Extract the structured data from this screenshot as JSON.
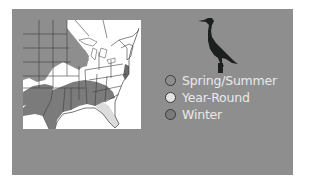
{
  "figure": {
    "icon": "cormorant-silhouette-icon",
    "colors": {
      "panel_background": "#8e8e8e",
      "map_background": "#ffffff",
      "spring_summer": "#8e8e8e",
      "year_round": "#e4e4e4",
      "winter": "#7b7b7b",
      "state_lines": "#3c3c3c"
    }
  },
  "legend": {
    "items": [
      {
        "label": "Spring/Summer",
        "color": "#8e8e8e"
      },
      {
        "label": "Year-Round",
        "color": "#e4e4e4"
      },
      {
        "label": "Winter",
        "color": "#7b7b7b"
      }
    ]
  }
}
